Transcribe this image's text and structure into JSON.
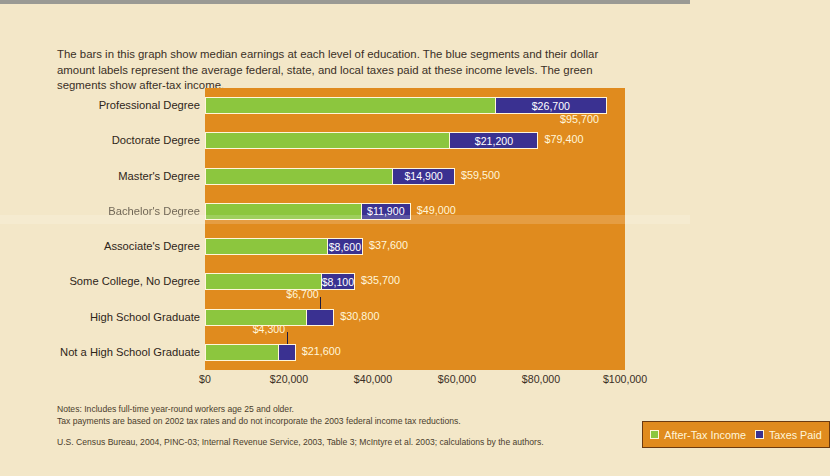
{
  "intro": "The bars in this graph show median earnings at each level of education. The blue segments and their dollar amount labels represent the average federal, state, and local taxes paid at these income levels. The green segments show after-tax income.",
  "legend": {
    "after_tax_label": "After-Tax Income",
    "taxes_label": "Taxes Paid"
  },
  "notes": {
    "line1": "Notes: Includes full-time year-round workers age 25 and older.",
    "line2": "Tax payments are based on 2002 tax rates and do not incorporate the 2003 federal income tax reductions.",
    "source": "U.S. Census Bureau, 2004, PINC-03; Internal Revenue Service, 2003, Table 3; McIntyre et al. 2003; calculations by the authors."
  },
  "colors": {
    "after_tax_green": "#8CC63E",
    "taxes_blue": "#3A3191",
    "plot_background": "#E08B1E",
    "page_background": "#F3E7C8",
    "label_cream": "#FFF6DA"
  },
  "chart_data": {
    "type": "bar",
    "orientation": "horizontal",
    "stacked": true,
    "title": "",
    "xlabel": "",
    "ylabel": "",
    "xlim": [
      0,
      100000
    ],
    "grid": false,
    "legend_position": "inside-bottom-right",
    "tick_labels": [
      "$0",
      "$20,000",
      "$40,000",
      "$60,000",
      "$80,000",
      "$100,000"
    ],
    "tick_values": [
      0,
      20000,
      40000,
      60000,
      80000,
      100000
    ],
    "categories": [
      "Professional Degree",
      "Doctorate Degree",
      "Master's Degree",
      "Bachelor's Degree",
      "Associate's Degree",
      "Some College, No Degree",
      "High School Graduate",
      "Not a High School Graduate"
    ],
    "series": [
      {
        "name": "After-Tax Income",
        "values": [
          69000,
          58200,
          44600,
          37100,
          29000,
          27600,
          24100,
          17300
        ]
      },
      {
        "name": "Taxes Paid",
        "values": [
          26700,
          21200,
          14900,
          11900,
          8600,
          8100,
          6700,
          4300
        ]
      }
    ],
    "totals": [
      95700,
      79400,
      59500,
      49000,
      37600,
      35700,
      30800,
      21600
    ],
    "total_labels": [
      "$95,700",
      "$79,400",
      "$59,500",
      "$49,000",
      "$37,600",
      "$35,700",
      "$30,800",
      "$21,600"
    ],
    "tax_labels": [
      "$26,700",
      "$21,200",
      "$14,900",
      "$11,900",
      "$8,600",
      "$8,100",
      "$6,700",
      "$4,300"
    ]
  },
  "rows": [
    {
      "category": "Professional Degree",
      "tax_label": "$26,700",
      "total_label": "$95,700",
      "total": 95700,
      "tax": 26700,
      "tax_inside": true,
      "total_below": true,
      "blurred": false
    },
    {
      "category": "Doctorate Degree",
      "tax_label": "$21,200",
      "total_label": "$79,400",
      "total": 79400,
      "tax": 21200,
      "tax_inside": true,
      "total_below": false,
      "blurred": false
    },
    {
      "category": "Master's Degree",
      "tax_label": "$14,900",
      "total_label": "$59,500",
      "total": 59500,
      "tax": 14900,
      "tax_inside": true,
      "total_below": false,
      "blurred": false
    },
    {
      "category": "Bachelor's Degree",
      "tax_label": "$11,900",
      "total_label": "$49,000",
      "total": 49000,
      "tax": 11900,
      "tax_inside": true,
      "total_below": false,
      "blurred": true
    },
    {
      "category": "Associate's Degree",
      "tax_label": "$8,600",
      "total_label": "$37,600",
      "total": 37600,
      "tax": 8600,
      "tax_inside": true,
      "total_below": false,
      "blurred": false
    },
    {
      "category": "Some College, No Degree",
      "tax_label": "$8,100",
      "total_label": "$35,700",
      "total": 35700,
      "tax": 8100,
      "tax_inside": true,
      "total_below": false,
      "blurred": false
    },
    {
      "category": "High School Graduate",
      "tax_label": "$6,700",
      "total_label": "$30,800",
      "total": 30800,
      "tax": 6700,
      "tax_inside": false,
      "total_below": false,
      "blurred": false
    },
    {
      "category": "Not a High School Graduate",
      "tax_label": "$4,300",
      "total_label": "$21,600",
      "total": 21600,
      "tax": 4300,
      "tax_inside": false,
      "total_below": false,
      "blurred": false
    }
  ]
}
